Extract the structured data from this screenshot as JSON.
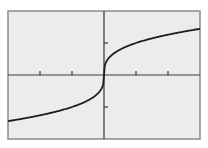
{
  "chart_data": {
    "type": "line",
    "title": "",
    "xlabel": "",
    "ylabel": "",
    "function": "y = cbrt(x)",
    "xlim": [
      -3,
      3
    ],
    "ylim": [
      -2,
      2
    ],
    "x_ticks": [
      -2,
      -1,
      1,
      2
    ],
    "y_ticks": [
      -1,
      1
    ],
    "x_tick_labels": [],
    "y_tick_labels": [],
    "grid": false,
    "legend": null,
    "series": [
      {
        "name": "cbrt(x)",
        "x": [
          -3,
          -2.5,
          -2,
          -1.5,
          -1,
          -0.5,
          -0.25,
          -0.1,
          -0.02,
          0,
          0.02,
          0.1,
          0.25,
          0.5,
          1,
          1.5,
          2,
          2.5,
          3
        ],
        "values": [
          -1.442,
          -1.357,
          -1.26,
          -1.145,
          -1.0,
          -0.794,
          -0.63,
          -0.464,
          -0.271,
          0,
          0.271,
          0.464,
          0.63,
          0.794,
          1.0,
          1.145,
          1.26,
          1.357,
          1.442
        ]
      }
    ]
  },
  "style": {
    "background": "#ffffff",
    "plot_background": "#ececec",
    "frame_color": "#8a8a8a",
    "axis_color": "#3a3a3a",
    "curve_color": "#1e1e1e"
  }
}
